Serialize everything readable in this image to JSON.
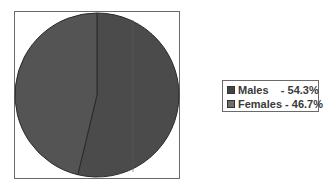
{
  "chart_data": {
    "type": "pie",
    "title": "",
    "categories": [
      "Males",
      "Females"
    ],
    "values": [
      54.3,
      46.7
    ],
    "labels": [
      "Males    - 54.3%",
      "Females - 46.7%"
    ],
    "colors": [
      "#4b4b4b",
      "#545454"
    ],
    "legend_swatch_colors": [
      "#444444",
      "#6e6e6e"
    ],
    "legend_position": "right",
    "start_angle": "top, clockwise"
  },
  "legend": {
    "items": [
      {
        "label": "Males    - 54.3%"
      },
      {
        "label": "Females - 46.7%"
      }
    ]
  }
}
